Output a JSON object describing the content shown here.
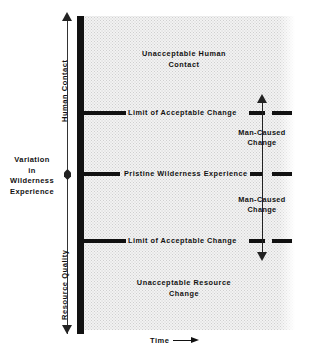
{
  "figure": {
    "colors": {
      "ink": "#111111",
      "field": "#f2f2f2",
      "field_dots": "#cfcfcf",
      "page": "#ffffff"
    }
  },
  "axes": {
    "vertical_upper_label": "Human Contact",
    "vertical_middle_label_lines": [
      "Variation",
      "in",
      "Wilderness",
      "Experience"
    ],
    "vertical_lower_label": "Resource Quality",
    "horizontal_label": "Time",
    "horizontal_arrow_icon": "arrow-right-icon",
    "upper_arrow_icon": "arrow-up-icon",
    "lower_arrow_icon": "arrow-down-icon",
    "middle_marker_icon": "diamond-marker-icon"
  },
  "zones": {
    "upper": {
      "line1": "Unacceptable  Human",
      "line2": "Contact"
    },
    "lower": {
      "line1": "Unacceptable Resource",
      "line2": "Change"
    }
  },
  "thresholds": [
    {
      "id": "upper-limit",
      "label": "Limit of Acceptable Change"
    },
    {
      "id": "pristine",
      "label": "Pristine Wilderness Experience"
    },
    {
      "id": "lower-limit",
      "label": "Limit of Acceptable Change"
    }
  ],
  "annotations": {
    "man_caused_change_top": {
      "line1": "Man-Caused",
      "line2": "Change",
      "direction": "up"
    },
    "man_caused_change_bottom": {
      "line1": "Man-Caused",
      "line2": "Change",
      "direction": "down"
    }
  },
  "chart_data": {
    "type": "diagram",
    "xlabel": "Time",
    "ylabel": "Variation in Wilderness Experience",
    "y_upper_direction_label": "Human Contact",
    "y_lower_direction_label": "Resource Quality",
    "grid": false,
    "legend": "none",
    "bands": [
      {
        "name": "Unacceptable Human Contact",
        "region": "above upper limit",
        "y_top": 1.0,
        "y_bottom": 0.72
      },
      {
        "name": "Acceptable range (human contact side)",
        "region": "upper limit to pristine",
        "y_top": 0.72,
        "y_bottom": 0.5
      },
      {
        "name": "Acceptable range (resource quality side)",
        "region": "pristine to lower limit",
        "y_top": 0.5,
        "y_bottom": 0.28
      },
      {
        "name": "Unacceptable Resource Change",
        "region": "below lower limit",
        "y_top": 0.28,
        "y_bottom": 0.0
      }
    ],
    "reference_lines": [
      {
        "label": "Limit of Acceptable Change",
        "y": 0.72
      },
      {
        "label": "Pristine Wilderness Experience",
        "y": 0.5
      },
      {
        "label": "Limit of Acceptable Change",
        "y": 0.28
      }
    ],
    "arrows": [
      {
        "label": "Man-Caused Change",
        "from_y": 0.5,
        "to_y": 0.76,
        "direction": "up"
      },
      {
        "label": "Man-Caused Change",
        "from_y": 0.5,
        "to_y": 0.24,
        "direction": "down"
      }
    ]
  }
}
